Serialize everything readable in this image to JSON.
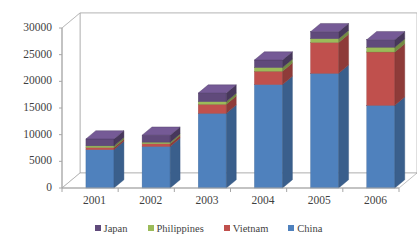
{
  "chart_data": {
    "type": "bar",
    "subtype": "stacked-3d-column",
    "title": "",
    "subtitle": "",
    "xlabel": "",
    "ylabel": "",
    "categories": [
      "2001",
      "2002",
      "2003",
      "2004",
      "2005",
      "2006"
    ],
    "ylim": [
      0,
      30000
    ],
    "yticks": [
      0,
      5000,
      10000,
      15000,
      20000,
      25000,
      30000
    ],
    "ytick_labels": [
      "0",
      "5000",
      "10000",
      "15000",
      "20000",
      "25000",
      "30000"
    ],
    "grid": true,
    "grid_axis": "y",
    "legend_position": "bottom",
    "stack_order_bottom_to_top": [
      "China",
      "Vietnam",
      "Philippines",
      "Japan"
    ],
    "series": [
      {
        "name": "China",
        "color": "#4f81bd",
        "values": [
          7200,
          7800,
          14000,
          19400,
          21500,
          15500
        ]
      },
      {
        "name": "Vietnam",
        "color": "#c0504d",
        "values": [
          400,
          500,
          1700,
          2500,
          5800,
          10000
        ]
      },
      {
        "name": "Philippines",
        "color": "#9bbb59",
        "values": [
          300,
          300,
          500,
          700,
          700,
          900
        ]
      },
      {
        "name": "Japan",
        "color": "#604a7b",
        "values": [
          1300,
          1300,
          1600,
          1400,
          1300,
          1400
        ]
      }
    ],
    "totals": [
      9200,
      9900,
      17800,
      24000,
      29300,
      27800
    ]
  },
  "legend": {
    "entries": [
      {
        "label": "Japan",
        "color": "#604a7b"
      },
      {
        "label": "Philippines",
        "color": "#9bbb59"
      },
      {
        "label": "Vietnam",
        "color": "#c0504d"
      },
      {
        "label": "China",
        "color": "#4f81bd"
      }
    ]
  },
  "style": {
    "background": "#ffffff",
    "gridline_color": "#c9c9c9",
    "axis_color": "#a6a6a6",
    "text_color": "#3f3f3f"
  }
}
